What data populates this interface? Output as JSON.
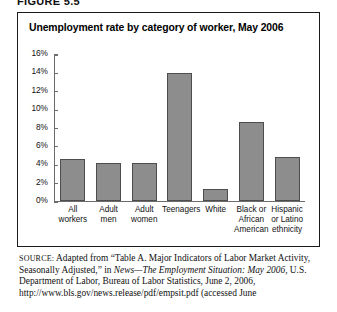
{
  "figure": {
    "label": "FIGURE 5.5"
  },
  "chart_data": {
    "type": "bar",
    "title": "Unemployment rate by category of worker, May 2006",
    "xlabel": "",
    "ylabel": "",
    "ylim": [
      0,
      16
    ],
    "yticks": [
      "0%",
      "2%",
      "4%",
      "6%",
      "8%",
      "10%",
      "12%",
      "14%",
      "16%"
    ],
    "ytick_values": [
      0,
      2,
      4,
      6,
      8,
      10,
      12,
      14,
      16
    ],
    "grid": false,
    "legend": "none",
    "bar_color": "#8d8d8d",
    "bar_border_color": "#4d4d4d",
    "categories": [
      "All workers",
      "Adult men",
      "Adult women",
      "Teenagers",
      "White",
      "Black or African American",
      "Hispanic or Latino ethnicity"
    ],
    "category_lines": [
      [
        "All",
        "workers"
      ],
      [
        "Adult",
        "men"
      ],
      [
        "Adult",
        "women"
      ],
      [
        "Teenagers"
      ],
      [
        "White"
      ],
      [
        "Black or",
        "African",
        "American"
      ],
      [
        "Hispanic",
        "or Latino",
        "ethnicity"
      ]
    ],
    "values": [
      4.6,
      4.2,
      4.1,
      14.0,
      1.3,
      8.7,
      4.8
    ],
    "units": "percent"
  },
  "source": {
    "prefix": "SOURCE:",
    "line1_a": " Adapted from “Table A. Major Indicators of Labor Market",
    "line2_a": "Activity, Seasonally Adjusted,” in ",
    "line2_i": "News—The Employment Situation:",
    "line3_i": "May 2006",
    "line3_a": ", U.S. Department of Labor, Bureau of Labor Statistics, June",
    "line4_a": "2, 2006, http://www.bls.gov/news.release/pdf/empsit.pdf (accessed June"
  }
}
